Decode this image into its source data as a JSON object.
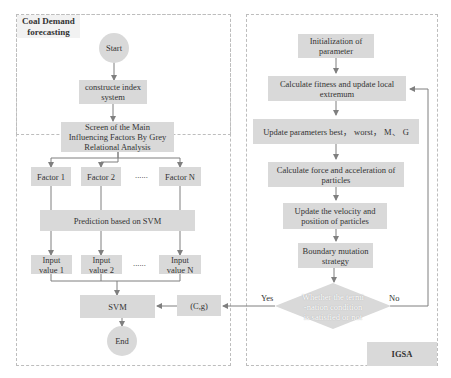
{
  "left_panel": {
    "title": "Coal Demand forecasting",
    "start": "Start",
    "construct": "constructe index system",
    "screen": "Screen of the Main Influencing Factors By Grey Relational Analysis",
    "factors": [
      "Factor 1",
      "Factor 2",
      "Factor N"
    ],
    "factor_ellipsis": "......",
    "prediction": "Prediction based on SVM",
    "inputs": [
      "Input value 1",
      "Input value 2",
      "Input value N"
    ],
    "input_ellipsis": "......",
    "svm": "SVM",
    "end": "End"
  },
  "params_box": "(C,g)",
  "right_panel": {
    "title": "IGSA",
    "init": "Initialization of parameter",
    "fitness": "Calculate fitness and update local extremum",
    "update_params": "Update parameters best， worst， M、 G",
    "force": "Calculate force and acceleration of particles",
    "velocity": "Update the velocity and position of particles",
    "boundary": "Boundary mutation strategy",
    "decision": "Whether the termi -nation condition is satisfied or not",
    "yes_label": "Yes",
    "no_label": "No"
  },
  "colors": {
    "box_fill": "#d9d9d9",
    "line": "#7f7f7f",
    "frame_border": "#bdbdbd"
  }
}
